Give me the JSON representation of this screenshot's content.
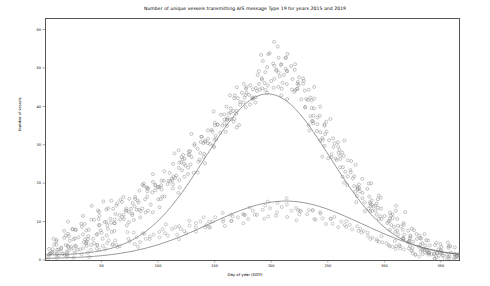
{
  "chart_data": {
    "type": "scatter",
    "title": "Number of unique vessels transmitting AIS message Type 19 for years 2015 and 2019",
    "xlabel": "Day of year (DOY)",
    "ylabel": "Number of vessels",
    "xlim": [
      0,
      366
    ],
    "ylim": [
      0,
      63
    ],
    "xticks": [
      50,
      100,
      150,
      200,
      250,
      300,
      350
    ],
    "yticks": [
      0,
      10,
      20,
      30,
      40,
      50,
      60
    ],
    "grid": false,
    "legend": "none",
    "series": [
      {
        "name": "2019",
        "marker": "circle-open",
        "color": "#808080",
        "trend_peak_doy": 196,
        "trend_peak_value": 42,
        "points": [
          [
            2,
            3
          ],
          [
            4,
            2
          ],
          [
            6,
            4
          ],
          [
            8,
            2
          ],
          [
            10,
            5
          ],
          [
            12,
            3
          ],
          [
            14,
            6
          ],
          [
            16,
            4
          ],
          [
            18,
            2
          ],
          [
            20,
            7
          ],
          [
            22,
            5
          ],
          [
            24,
            8
          ],
          [
            26,
            4
          ],
          [
            28,
            6
          ],
          [
            30,
            9
          ],
          [
            32,
            5
          ],
          [
            34,
            7
          ],
          [
            36,
            10
          ],
          [
            38,
            6
          ],
          [
            40,
            8
          ],
          [
            42,
            11
          ],
          [
            44,
            7
          ],
          [
            46,
            9
          ],
          [
            48,
            12
          ],
          [
            50,
            8
          ],
          [
            52,
            10
          ],
          [
            54,
            13
          ],
          [
            56,
            9
          ],
          [
            58,
            11
          ],
          [
            60,
            14
          ],
          [
            62,
            10
          ],
          [
            64,
            12
          ],
          [
            66,
            15
          ],
          [
            68,
            11
          ],
          [
            70,
            13
          ],
          [
            72,
            16
          ],
          [
            74,
            12
          ],
          [
            76,
            14
          ],
          [
            78,
            17
          ],
          [
            80,
            13
          ],
          [
            82,
            16
          ],
          [
            84,
            18
          ],
          [
            86,
            14
          ],
          [
            88,
            17
          ],
          [
            90,
            19
          ],
          [
            92,
            15
          ],
          [
            94,
            18
          ],
          [
            96,
            20
          ],
          [
            98,
            16
          ],
          [
            100,
            19
          ],
          [
            102,
            21
          ],
          [
            104,
            17
          ],
          [
            106,
            20
          ],
          [
            108,
            23
          ],
          [
            110,
            19
          ],
          [
            112,
            22
          ],
          [
            114,
            25
          ],
          [
            116,
            21
          ],
          [
            118,
            24
          ],
          [
            120,
            26
          ],
          [
            122,
            22
          ],
          [
            124,
            25
          ],
          [
            126,
            28
          ],
          [
            128,
            24
          ],
          [
            130,
            27
          ],
          [
            132,
            30
          ],
          [
            134,
            26
          ],
          [
            136,
            29
          ],
          [
            138,
            32
          ],
          [
            140,
            28
          ],
          [
            142,
            31
          ],
          [
            144,
            34
          ],
          [
            146,
            30
          ],
          [
            148,
            33
          ],
          [
            150,
            36
          ],
          [
            152,
            32
          ],
          [
            154,
            35
          ],
          [
            156,
            38
          ],
          [
            158,
            34
          ],
          [
            160,
            37
          ],
          [
            162,
            40
          ],
          [
            164,
            36
          ],
          [
            166,
            39
          ],
          [
            168,
            42
          ],
          [
            170,
            38
          ],
          [
            172,
            41
          ],
          [
            174,
            44
          ],
          [
            176,
            40
          ],
          [
            178,
            43
          ],
          [
            180,
            46
          ],
          [
            182,
            42
          ],
          [
            184,
            45
          ],
          [
            186,
            48
          ],
          [
            188,
            44
          ],
          [
            190,
            47
          ],
          [
            192,
            52
          ],
          [
            194,
            46
          ],
          [
            196,
            49
          ],
          [
            198,
            54
          ],
          [
            200,
            47
          ],
          [
            202,
            50
          ],
          [
            204,
            56
          ],
          [
            206,
            48
          ],
          [
            208,
            51
          ],
          [
            210,
            45
          ],
          [
            212,
            49
          ],
          [
            214,
            53
          ],
          [
            216,
            47
          ],
          [
            218,
            50
          ],
          [
            220,
            44
          ],
          [
            222,
            48
          ],
          [
            224,
            42
          ],
          [
            226,
            46
          ],
          [
            228,
            40
          ],
          [
            230,
            44
          ],
          [
            232,
            38
          ],
          [
            234,
            42
          ],
          [
            236,
            36
          ],
          [
            238,
            40
          ],
          [
            240,
            34
          ],
          [
            242,
            38
          ],
          [
            244,
            32
          ],
          [
            246,
            36
          ],
          [
            248,
            30
          ],
          [
            250,
            34
          ],
          [
            252,
            28
          ],
          [
            254,
            32
          ],
          [
            256,
            26
          ],
          [
            258,
            30
          ],
          [
            260,
            24
          ],
          [
            262,
            28
          ],
          [
            264,
            22
          ],
          [
            266,
            26
          ],
          [
            268,
            20
          ],
          [
            270,
            24
          ],
          [
            272,
            18
          ],
          [
            274,
            22
          ],
          [
            276,
            17
          ],
          [
            278,
            20
          ],
          [
            280,
            15
          ],
          [
            282,
            19
          ],
          [
            284,
            14
          ],
          [
            286,
            17
          ],
          [
            288,
            13
          ],
          [
            290,
            16
          ],
          [
            292,
            12
          ],
          [
            294,
            15
          ],
          [
            296,
            11
          ],
          [
            298,
            14
          ],
          [
            300,
            10
          ],
          [
            302,
            13
          ],
          [
            304,
            9
          ],
          [
            306,
            12
          ],
          [
            308,
            8
          ],
          [
            310,
            11
          ],
          [
            312,
            7
          ],
          [
            314,
            10
          ],
          [
            316,
            6
          ],
          [
            318,
            9
          ],
          [
            320,
            5
          ],
          [
            322,
            8
          ],
          [
            324,
            5
          ],
          [
            326,
            7
          ],
          [
            328,
            4
          ],
          [
            330,
            6
          ],
          [
            332,
            3
          ],
          [
            334,
            5
          ],
          [
            336,
            3
          ],
          [
            338,
            4
          ],
          [
            340,
            2
          ],
          [
            342,
            4
          ],
          [
            344,
            2
          ],
          [
            346,
            3
          ],
          [
            348,
            2
          ],
          [
            350,
            3
          ],
          [
            352,
            2
          ],
          [
            354,
            2
          ],
          [
            356,
            1
          ],
          [
            358,
            2
          ],
          [
            360,
            1
          ],
          [
            362,
            2
          ],
          [
            364,
            1
          ]
        ]
      },
      {
        "name": "2015",
        "marker": "circle-open",
        "color": "#909090",
        "trend_peak_doy": 212,
        "trend_peak_value": 15,
        "points": [
          [
            3,
            1
          ],
          [
            7,
            2
          ],
          [
            11,
            1
          ],
          [
            15,
            2
          ],
          [
            19,
            1
          ],
          [
            23,
            3
          ],
          [
            27,
            2
          ],
          [
            31,
            3
          ],
          [
            35,
            2
          ],
          [
            39,
            4
          ],
          [
            43,
            3
          ],
          [
            47,
            4
          ],
          [
            51,
            3
          ],
          [
            55,
            5
          ],
          [
            59,
            4
          ],
          [
            63,
            5
          ],
          [
            67,
            4
          ],
          [
            71,
            6
          ],
          [
            75,
            5
          ],
          [
            79,
            6
          ],
          [
            83,
            5
          ],
          [
            87,
            7
          ],
          [
            91,
            6
          ],
          [
            95,
            7
          ],
          [
            99,
            6
          ],
          [
            103,
            8
          ],
          [
            107,
            7
          ],
          [
            111,
            8
          ],
          [
            115,
            7
          ],
          [
            119,
            9
          ],
          [
            123,
            8
          ],
          [
            127,
            9
          ],
          [
            131,
            8
          ],
          [
            135,
            10
          ],
          [
            139,
            9
          ],
          [
            143,
            10
          ],
          [
            147,
            9
          ],
          [
            151,
            11
          ],
          [
            155,
            10
          ],
          [
            159,
            11
          ],
          [
            163,
            10
          ],
          [
            167,
            12
          ],
          [
            171,
            11
          ],
          [
            175,
            12
          ],
          [
            179,
            11
          ],
          [
            183,
            13
          ],
          [
            187,
            12
          ],
          [
            191,
            13
          ],
          [
            195,
            12
          ],
          [
            199,
            14
          ],
          [
            203,
            13
          ],
          [
            207,
            14
          ],
          [
            211,
            15
          ],
          [
            215,
            13
          ],
          [
            219,
            14
          ],
          [
            223,
            12
          ],
          [
            227,
            13
          ],
          [
            231,
            12
          ],
          [
            235,
            13
          ],
          [
            239,
            11
          ],
          [
            243,
            12
          ],
          [
            247,
            10
          ],
          [
            251,
            11
          ],
          [
            255,
            10
          ],
          [
            259,
            10
          ],
          [
            263,
            9
          ],
          [
            267,
            9
          ],
          [
            271,
            8
          ],
          [
            275,
            8
          ],
          [
            279,
            7
          ],
          [
            283,
            7
          ],
          [
            287,
            6
          ],
          [
            291,
            6
          ],
          [
            295,
            5
          ],
          [
            299,
            5
          ],
          [
            303,
            4
          ],
          [
            307,
            4
          ],
          [
            311,
            4
          ],
          [
            315,
            3
          ],
          [
            319,
            3
          ],
          [
            323,
            3
          ],
          [
            327,
            2
          ],
          [
            331,
            2
          ],
          [
            335,
            2
          ],
          [
            339,
            2
          ],
          [
            343,
            1
          ],
          [
            347,
            1
          ],
          [
            351,
            1
          ],
          [
            355,
            1
          ],
          [
            359,
            1
          ],
          [
            363,
            1
          ]
        ]
      }
    ]
  }
}
